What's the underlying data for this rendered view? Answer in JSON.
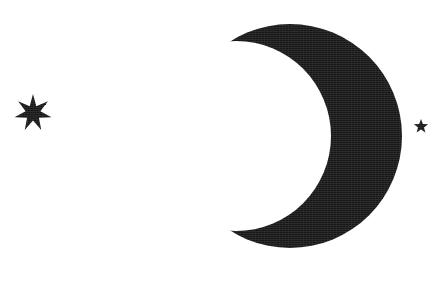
{
  "artwork": {
    "title": "Crescent moon with stars",
    "alt_text": "Black crescent moon opening to the left, a large seven-pointed star at the left and a small five-pointed star at the right, on a white background",
    "background_color": "#ffffff",
    "ink_color": "#161616",
    "canvas": {
      "width": 441,
      "height": 282
    },
    "style": "scanned black-and-white clip art silhouette"
  },
  "shapes": {
    "moon": {
      "name": "crescent-moon",
      "label": "Crescent moon",
      "fill": "#161616",
      "opening_direction": "left",
      "bounds": {
        "x": 203,
        "y": 22,
        "width": 185,
        "height": 225
      },
      "outer_circle": {
        "cx": 290,
        "cy": 136,
        "r": 112
      },
      "inner_circle": {
        "cx": 236,
        "cy": 136,
        "r": 95
      },
      "upper_tip": {
        "x": 247,
        "y": 23
      },
      "lower_tip": {
        "x": 204,
        "y": 228
      }
    },
    "star_large": {
      "name": "seven-pointed-star",
      "label": "Seven-pointed star",
      "fill": "#161616",
      "points": 7,
      "center": {
        "x": 33,
        "y": 113
      },
      "outer_radius": 19,
      "inner_radius": 7.6,
      "rotation_deg": 0,
      "bounds": {
        "x": 14,
        "y": 94,
        "width": 38,
        "height": 38
      }
    },
    "star_small": {
      "name": "five-pointed-star",
      "label": "Five-pointed star",
      "fill": "#161616",
      "points": 5,
      "center": {
        "x": 421,
        "y": 126.5
      },
      "outer_radius": 7.5,
      "inner_radius": 3.1,
      "rotation_deg": 0,
      "bounds": {
        "x": 413,
        "y": 119,
        "width": 16,
        "height": 15
      }
    }
  }
}
